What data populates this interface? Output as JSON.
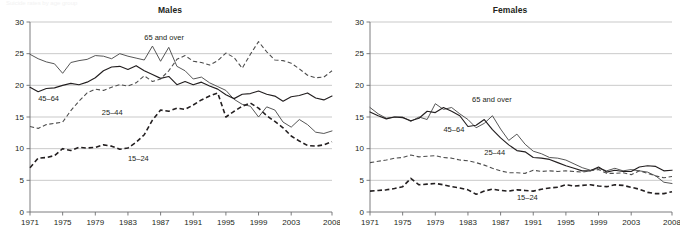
{
  "figure": {
    "panels": [
      "Males",
      "Females"
    ],
    "ghost_caption": "Suicide rates by age group"
  },
  "chart_data": [
    {
      "type": "line",
      "title": "Males",
      "xlabel": "",
      "ylabel": "",
      "xlim": [
        1971,
        2008
      ],
      "ylim": [
        0,
        30
      ],
      "ytick_labels": [
        "0",
        "5",
        "10",
        "15",
        "20",
        "25",
        "30"
      ],
      "ytick_values": [
        0,
        5,
        10,
        15,
        20,
        25,
        30
      ],
      "xtick_labels": [
        "1971",
        "1975",
        "1979",
        "1983",
        "1987",
        "1991",
        "1995",
        "1999",
        "2003",
        "2008"
      ],
      "xtick_values": [
        1971,
        1975,
        1979,
        1983,
        1987,
        1991,
        1995,
        1999,
        2003,
        2008
      ],
      "grid": true,
      "legend": "inline-labels",
      "x": [
        1971,
        1972,
        1973,
        1974,
        1975,
        1976,
        1977,
        1978,
        1979,
        1980,
        1981,
        1982,
        1983,
        1984,
        1985,
        1986,
        1987,
        1988,
        1989,
        1990,
        1991,
        1992,
        1993,
        1994,
        1995,
        1996,
        1997,
        1998,
        1999,
        2000,
        2001,
        2002,
        2003,
        2004,
        2005,
        2006,
        2007,
        2008
      ],
      "series": [
        {
          "name": "65 and over",
          "style": "solid-thin",
          "values": [
            24.9,
            24.2,
            23.7,
            23.4,
            21.9,
            23.6,
            23.9,
            24.1,
            24.7,
            24.6,
            24.2,
            25.0,
            24.6,
            24.3,
            24.0,
            26.2,
            23.8,
            26.0,
            23.0,
            22.3,
            21.0,
            21.3,
            20.4,
            19.8,
            19.2,
            17.8,
            17.0,
            16.7,
            15.0,
            16.6,
            16.1,
            14.2,
            13.4,
            14.6,
            13.8,
            12.6,
            12.4,
            12.8
          ]
        },
        {
          "name": "45–64",
          "style": "solid-thick",
          "values": [
            19.7,
            19.0,
            19.5,
            19.6,
            20.0,
            20.3,
            20.1,
            20.5,
            21.2,
            22.3,
            22.9,
            23.0,
            22.5,
            23.1,
            22.3,
            21.7,
            21.1,
            21.4,
            20.1,
            20.6,
            20.1,
            20.5,
            19.9,
            19.4,
            18.5,
            17.9,
            18.6,
            18.7,
            19.1,
            18.6,
            18.3,
            17.5,
            18.2,
            18.4,
            18.8,
            18.0,
            17.7,
            18.3
          ]
        },
        {
          "name": "25–44",
          "style": "dash-thin",
          "values": [
            13.5,
            13.2,
            13.8,
            14.0,
            14.2,
            16.0,
            17.5,
            18.8,
            19.4,
            19.2,
            19.7,
            20.1,
            19.9,
            20.4,
            21.5,
            20.6,
            21.0,
            22.3,
            24.1,
            24.7,
            23.8,
            23.6,
            23.2,
            23.9,
            25.1,
            24.4,
            22.7,
            24.9,
            26.9,
            25.3,
            24.0,
            23.9,
            23.5,
            22.6,
            21.6,
            21.2,
            21.3,
            22.3
          ]
        },
        {
          "name": "15–24",
          "style": "dash-thick",
          "values": [
            7.0,
            8.5,
            8.6,
            8.9,
            10.0,
            9.7,
            10.2,
            10.1,
            10.2,
            10.6,
            10.4,
            9.9,
            10.1,
            11.0,
            12.2,
            14.5,
            16.1,
            15.9,
            16.4,
            16.2,
            16.9,
            17.7,
            18.3,
            18.8,
            15.0,
            15.9,
            16.7,
            17.2,
            16.4,
            15.2,
            14.3,
            13.3,
            12.0,
            11.2,
            10.5,
            10.4,
            10.6,
            11.1
          ]
        }
      ],
      "annotations": [
        {
          "text": "65 and over",
          "x": 1985.0,
          "y": 27.2
        },
        {
          "text": "45–64",
          "x": 1972.0,
          "y": 17.5
        },
        {
          "text": "25–44",
          "x": 1979.8,
          "y": 15.3
        },
        {
          "text": "15–24",
          "x": 1983.0,
          "y": 8.0
        }
      ]
    },
    {
      "type": "line",
      "title": "Females",
      "xlabel": "",
      "ylabel": "",
      "xlim": [
        1971,
        2008
      ],
      "ylim": [
        0,
        30
      ],
      "ytick_labels": [
        "0",
        "5",
        "10",
        "15",
        "20",
        "25",
        "30"
      ],
      "ytick_values": [
        0,
        5,
        10,
        15,
        20,
        25,
        30
      ],
      "xtick_labels": [
        "1971",
        "1975",
        "1979",
        "1983",
        "1987",
        "1991",
        "1995",
        "1999",
        "2003",
        "2008"
      ],
      "xtick_values": [
        1971,
        1975,
        1979,
        1983,
        1987,
        1991,
        1995,
        1999,
        2003,
        2008
      ],
      "grid": true,
      "legend": "inline-labels",
      "x": [
        1971,
        1972,
        1973,
        1974,
        1975,
        1976,
        1977,
        1978,
        1979,
        1980,
        1981,
        1982,
        1983,
        1984,
        1985,
        1986,
        1987,
        1988,
        1989,
        1990,
        1991,
        1992,
        1993,
        1994,
        1995,
        1996,
        1997,
        1998,
        1999,
        2000,
        2001,
        2002,
        2003,
        2004,
        2005,
        2006,
        2007,
        2008
      ],
      "series": [
        {
          "name": "65 and over",
          "style": "solid-thin",
          "values": [
            16.5,
            15.5,
            14.8,
            15.0,
            15.0,
            14.3,
            15.0,
            14.6,
            17.1,
            16.2,
            16.5,
            15.5,
            14.6,
            13.3,
            14.0,
            15.2,
            13.1,
            11.3,
            12.3,
            10.7,
            9.6,
            9.2,
            8.6,
            8.5,
            8.2,
            7.6,
            7.0,
            6.6,
            6.9,
            6.5,
            6.9,
            6.5,
            6.7,
            6.5,
            6.3,
            5.7,
            4.7,
            4.5
          ]
        },
        {
          "name": "45–64",
          "style": "solid-thick",
          "values": [
            15.8,
            15.2,
            14.7,
            15.0,
            14.9,
            14.4,
            14.8,
            15.9,
            15.7,
            16.5,
            15.9,
            15.2,
            13.5,
            13.7,
            14.6,
            13.0,
            11.7,
            10.6,
            9.7,
            9.5,
            8.6,
            8.5,
            8.3,
            7.8,
            7.3,
            6.9,
            6.5,
            6.5,
            7.1,
            6.3,
            6.6,
            6.4,
            6.4,
            7.1,
            7.3,
            7.2,
            6.5,
            6.6
          ]
        },
        {
          "name": "25–44",
          "style": "dash-thin",
          "values": [
            7.8,
            8.0,
            8.2,
            8.5,
            8.6,
            9.0,
            8.7,
            8.8,
            8.9,
            8.6,
            8.5,
            8.2,
            8.1,
            7.8,
            7.4,
            6.9,
            6.5,
            6.2,
            6.2,
            6.1,
            6.6,
            6.4,
            6.5,
            6.4,
            6.5,
            6.4,
            6.3,
            6.5,
            6.7,
            6.1,
            6.1,
            6.2,
            5.9,
            6.5,
            6.1,
            5.7,
            5.4,
            5.6
          ]
        },
        {
          "name": "15–24",
          "style": "dash-thick",
          "values": [
            3.3,
            3.4,
            3.5,
            3.7,
            4.0,
            5.3,
            4.3,
            4.4,
            4.5,
            4.3,
            4.0,
            3.8,
            3.5,
            2.8,
            3.3,
            3.6,
            3.4,
            3.3,
            3.5,
            3.4,
            3.3,
            3.6,
            3.8,
            3.9,
            4.3,
            4.1,
            4.2,
            4.3,
            4.1,
            4.0,
            4.3,
            4.2,
            3.9,
            3.6,
            3.1,
            2.9,
            2.9,
            3.2
          ]
        }
      ],
      "annotations": [
        {
          "text": "65 and over",
          "x": 1983.5,
          "y": 17.4
        },
        {
          "text": "45–64",
          "x": 1980.0,
          "y": 12.6
        },
        {
          "text": "25–44",
          "x": 1985.0,
          "y": 9.0
        },
        {
          "text": "15–24",
          "x": 1989.0,
          "y": 1.9
        }
      ]
    }
  ],
  "colors": {
    "ink": "#231f20",
    "grid": "#b3b3b3",
    "axis": "#6d6e71",
    "thin_line": "#4d4d4d"
  }
}
